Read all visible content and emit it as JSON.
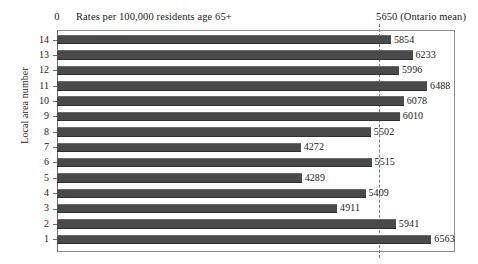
{
  "chart_data": {
    "type": "bar",
    "orientation": "horizontal",
    "title": "Rates per 100,000 residents age 65+",
    "xlabel": "Rates per 100,000 residents age 65+",
    "ylabel": "Local area number",
    "xlim": [
      0,
      7000
    ],
    "grid": false,
    "legend": null,
    "x_tick_labels": [
      "0",
      "5650 (Ontario mean)"
    ],
    "x_axis_origin_label": "0",
    "reference_line": {
      "label": "5650 (Ontario mean)",
      "value": 5650,
      "style": "dashed"
    },
    "categories": [
      "14",
      "13",
      "12",
      "11",
      "10",
      "9",
      "8",
      "7",
      "6",
      "5",
      "4",
      "3",
      "2",
      "1"
    ],
    "values": [
      5854,
      6233,
      5996,
      6488,
      6078,
      6010,
      5502,
      4272,
      5515,
      4289,
      5409,
      4911,
      5941,
      6563
    ],
    "bars": [
      {
        "category": "14",
        "value": 5854,
        "label": "5854"
      },
      {
        "category": "13",
        "value": 6233,
        "label": "6233"
      },
      {
        "category": "12",
        "value": 5996,
        "label": "5996"
      },
      {
        "category": "11",
        "value": 6488,
        "label": "6488"
      },
      {
        "category": "10",
        "value": 6078,
        "label": "6078"
      },
      {
        "category": "9",
        "value": 6010,
        "label": "6010"
      },
      {
        "category": "8",
        "value": 5502,
        "label": "5502"
      },
      {
        "category": "7",
        "value": 4272,
        "label": "4272"
      },
      {
        "category": "6",
        "value": 5515,
        "label": "5515"
      },
      {
        "category": "5",
        "value": 4289,
        "label": "4289"
      },
      {
        "category": "4",
        "value": 5409,
        "label": "5409"
      },
      {
        "category": "3",
        "value": 4911,
        "label": "4911"
      },
      {
        "category": "2",
        "value": 5941,
        "label": "5941"
      },
      {
        "category": "1",
        "value": 6563,
        "label": "6563"
      }
    ]
  },
  "colors": {
    "bar_fill": "#4a4a4a",
    "frame": "#8d8d8d",
    "text": "#1a1a1a",
    "reference_line": "#7a7a7a",
    "background": "#ffffff"
  }
}
